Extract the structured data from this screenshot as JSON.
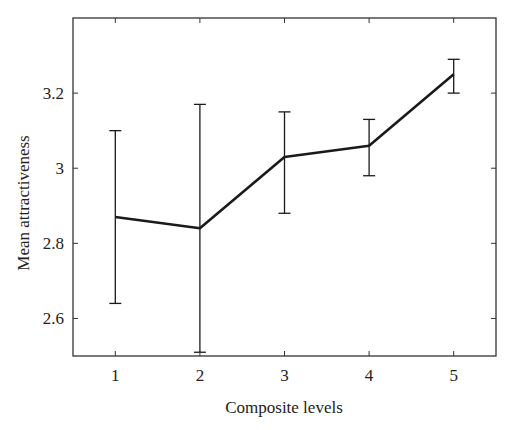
{
  "chart_data": {
    "type": "line",
    "title": "",
    "xlabel": "Composite levels",
    "ylabel": "Mean attractiveness",
    "x": [
      1,
      2,
      3,
      4,
      5
    ],
    "categories": [
      "1",
      "2",
      "3",
      "4",
      "5"
    ],
    "series": [
      {
        "name": "Mean attractiveness",
        "values": [
          2.87,
          2.84,
          3.03,
          3.06,
          3.25
        ],
        "error_upper": [
          3.1,
          3.17,
          3.15,
          3.13,
          3.29
        ],
        "error_lower": [
          2.64,
          2.51,
          2.88,
          2.98,
          3.2
        ]
      }
    ],
    "xlim": [
      0.5,
      5.5
    ],
    "ylim": [
      2.5,
      3.4
    ],
    "xticks": [
      1,
      2,
      3,
      4,
      5
    ],
    "xtick_labels": [
      "1",
      "2",
      "3",
      "4",
      "5"
    ],
    "yticks": [
      2.6,
      2.8,
      3.0,
      3.2
    ],
    "ytick_labels": [
      "2.6",
      "2.8",
      "3",
      "3.2"
    ],
    "grid": false,
    "legend": null,
    "colors": {
      "line": "#1a1a1a",
      "axis": "#333333",
      "background": "#ffffff"
    }
  }
}
